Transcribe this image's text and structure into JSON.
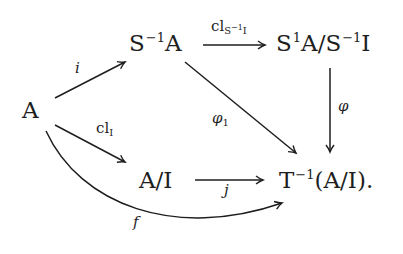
{
  "diagram": {
    "type": "commutative-diagram",
    "stroke_color": "#1e1e1e",
    "nodes": {
      "A": {
        "base": "A"
      },
      "S_inv_A": {
        "base": "S",
        "sup": "−1",
        "tail": "A"
      },
      "quotient_top": {
        "p1": "S",
        "sup1": "1",
        "p2": "A/S",
        "sup2": "−1",
        "p3": "I"
      },
      "A_mod_I": {
        "base": "A/I"
      },
      "T_inv": {
        "base": "T",
        "sup": "−1",
        "tail": "(A/I)."
      }
    },
    "arrows": [
      {
        "id": "i",
        "from": "A",
        "to": "S_inv_A",
        "label": "i"
      },
      {
        "id": "cl_I",
        "from": "A",
        "to": "A_mod_I",
        "label_base": "cl",
        "label_sub": "I"
      },
      {
        "id": "cl_S_inv_I",
        "from": "S_inv_A",
        "to": "quotient_top",
        "label_base": "cl",
        "label_sub_base": "S",
        "label_sub_sup": "−1",
        "label_sub_tail": "I"
      },
      {
        "id": "phi",
        "from": "quotient_top",
        "to": "T_inv",
        "label": "φ"
      },
      {
        "id": "phi_1",
        "from": "S_inv_A",
        "to": "T_inv",
        "label_base": "φ",
        "label_sub": "1"
      },
      {
        "id": "j",
        "from": "A_mod_I",
        "to": "T_inv",
        "label": "j"
      },
      {
        "id": "f",
        "from": "A",
        "to": "T_inv",
        "label": "f",
        "curved": true
      }
    ]
  }
}
